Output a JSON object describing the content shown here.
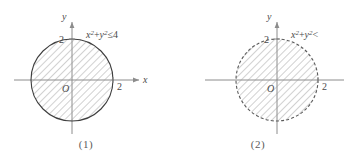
{
  "figures": [
    {
      "caption": "(1)",
      "inequality": {
        "var_x": "x",
        "exp_x": "2",
        "operator_plus": "+",
        "var_y": "y",
        "exp_y": "2",
        "relation": "≤",
        "value": "4",
        "full": "x²+y²≤4"
      },
      "axes": {
        "x_label": "x",
        "y_label": "y",
        "origin_label": "O",
        "x_tick_label": "2",
        "y_tick_label": "2"
      },
      "boundary_style": "solid",
      "region_fill": "hatched",
      "radius_units": 2
    },
    {
      "caption": "(2)",
      "inequality": {
        "var_x": "x",
        "exp_x": "2",
        "operator_plus": "+",
        "var_y": "y",
        "exp_y": "2",
        "relation": "<",
        "value": "",
        "full": "x²+y²<"
      },
      "axes": {
        "x_label": "",
        "y_label": "y",
        "origin_label": "O",
        "x_tick_label": "2",
        "y_tick_label": "2"
      },
      "boundary_style": "dashed",
      "region_fill": "hatched",
      "radius_units": 2
    }
  ],
  "colors": {
    "background": "#ffffff",
    "axis": "#8c8c8c",
    "boundary_solid": "#3f3f3f",
    "boundary_dashed": "#5a5a5a",
    "hatch": "#9a9a9a",
    "text": "#4a4a4a"
  }
}
